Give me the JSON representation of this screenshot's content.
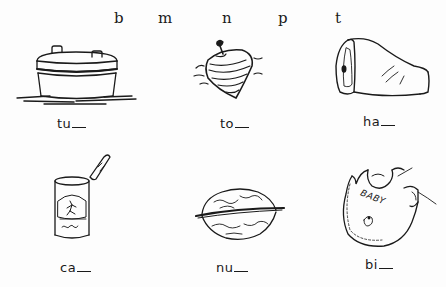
{
  "worksheet": {
    "letter_bank": [
      "b",
      "m",
      "n",
      "p",
      "t"
    ],
    "items": [
      {
        "picture": "tub",
        "icon": "tub-icon",
        "stub": "tu"
      },
      {
        "picture": "top",
        "icon": "spinning-top-icon",
        "stub": "to"
      },
      {
        "picture": "ham",
        "icon": "ham-icon",
        "stub": "ha"
      },
      {
        "picture": "can",
        "icon": "can-icon",
        "stub": "ca"
      },
      {
        "picture": "nut",
        "icon": "walnut-icon",
        "stub": "nu"
      },
      {
        "picture": "bib",
        "icon": "bib-icon",
        "stub": "bi",
        "bib_text": "BABY"
      }
    ]
  }
}
